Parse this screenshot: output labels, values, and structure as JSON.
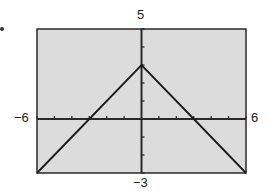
{
  "chart_data": {
    "type": "line",
    "title": "",
    "xlabel": "",
    "ylabel": "",
    "xlim": [
      -6,
      6
    ],
    "ylim": [
      -3,
      5
    ],
    "xtick_step": 1,
    "ytick_step": 1,
    "grid": false,
    "legend": null,
    "axis_labels": {
      "xmin": "−6",
      "xmax": "6",
      "ymin": "−3",
      "ymax": "5"
    },
    "series": [
      {
        "name": "y = 3 - |x|",
        "x": [
          -6,
          -3,
          0,
          3,
          6
        ],
        "y": [
          -3,
          0,
          3,
          0,
          -3
        ]
      }
    ],
    "colors": {
      "plot_bg": "#dcdcdc",
      "line": "#1a1a1a",
      "frame": "#2a2a2a"
    }
  }
}
